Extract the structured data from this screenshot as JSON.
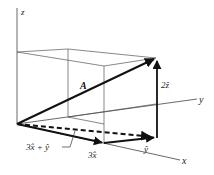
{
  "diagram": {
    "axes": {
      "x": "x",
      "y": "y",
      "z": "z"
    },
    "labels": {
      "A": "A",
      "two_z": "2ẑ",
      "three_x": "3x̂",
      "y_hat": "ŷ",
      "sum": "3x̂ + ŷ"
    },
    "colors": {
      "line": "#222222",
      "thin": "#555555",
      "background": "#ffffff"
    }
  }
}
